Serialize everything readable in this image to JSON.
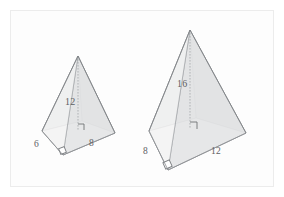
{
  "figure": {
    "background_color": "#ffffff",
    "page_tint": "#fdfdfd",
    "outline_color": "#8a8d91",
    "label_color": "#5d6063",
    "frame_color": "#ececec",
    "shading": {
      "left_face_fill": "#d7d8da",
      "right_face_fill": "#c9cacc",
      "front_face_fill": "#e9eaeb",
      "inner_face_fill": "#bfc1c3",
      "base_fill": "#ffffff",
      "height_line_color": "#9a9da0"
    },
    "pyramids": [
      {
        "name": "small-pyramid",
        "labels": {
          "height": "12",
          "left_base_edge": "6",
          "right_base_edge": "8"
        },
        "right_angle_marks": 2
      },
      {
        "name": "large-pyramid",
        "labels": {
          "height": "16",
          "left_base_edge": "8",
          "right_base_edge": "12"
        },
        "right_angle_marks": 2
      }
    ]
  }
}
